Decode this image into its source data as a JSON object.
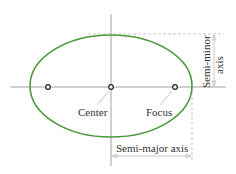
{
  "diagram": {
    "colors": {
      "ellipse": "#4a9a3a",
      "axis": "#8a8a8a",
      "dim": "#b0b0b0",
      "text": "#333333"
    },
    "labels": {
      "center": "Center",
      "focus": "Focus",
      "semi_major": "Semi-major axis",
      "semi_minor_line1": "Semi-minor",
      "semi_minor_line2": "axis"
    },
    "points": [
      {
        "name": "left-focus",
        "x": 48,
        "y": 87
      },
      {
        "name": "center",
        "x": 111,
        "y": 87
      },
      {
        "name": "right-focus",
        "x": 175,
        "y": 87
      }
    ]
  }
}
